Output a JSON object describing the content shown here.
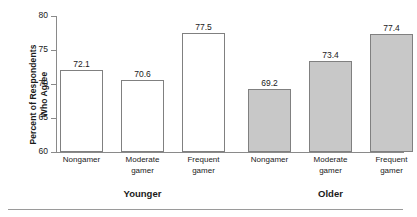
{
  "chart_data": {
    "type": "bar",
    "title": "",
    "xlabel": "",
    "ylabel": "Percent of Respondents\nWho Agree",
    "ylim": [
      60,
      80
    ],
    "yticks": [
      60,
      65,
      70,
      75,
      80
    ],
    "ytick_labels": [
      "60",
      "65",
      "70",
      "75",
      "80"
    ],
    "grid": false,
    "legend": null,
    "categories": [
      "Nongamer",
      "Moderate gamer",
      "Frequent gamer",
      "Nongamer",
      "Moderate gamer",
      "Frequent gamer"
    ],
    "values": [
      72.1,
      70.6,
      77.5,
      69.2,
      73.4,
      77.4
    ],
    "value_labels": [
      "72.1",
      "70.6",
      "77.5",
      "69.2",
      "73.4",
      "77.4"
    ],
    "bar_styles": [
      "open",
      "open",
      "open",
      "filled",
      "filled",
      "filled"
    ],
    "groups": [
      {
        "label": "Younger",
        "categories": [
          "Nongamer",
          "Moderate gamer",
          "Frequent gamer"
        ],
        "values": [
          72.1,
          70.6,
          77.5
        ],
        "style": "open"
      },
      {
        "label": "Older",
        "categories": [
          "Nongamer",
          "Moderate gamer",
          "Frequent gamer"
        ],
        "values": [
          69.2,
          73.4,
          77.4
        ],
        "style": "filled"
      }
    ],
    "colors": {
      "open_fill": "#ffffff",
      "filled_fill": "#c8c8c8",
      "bar_border": "#808080",
      "axis": "#8a8a8a",
      "text": "#1a1a1a"
    }
  },
  "category_label_lines": [
    [
      "Nongamer",
      ""
    ],
    [
      "Moderate",
      "gamer"
    ],
    [
      "Frequent",
      "gamer"
    ],
    [
      "Nongamer",
      ""
    ],
    [
      "Moderate",
      "gamer"
    ],
    [
      "Frequent",
      "gamer"
    ]
  ],
  "y_axis": {
    "title_line1": "Percent of Respondents",
    "title_line2": "Who Agree",
    "tick_labels": [
      "80",
      "75",
      "70",
      "65",
      "60"
    ]
  },
  "group_labels": {
    "younger": "Younger",
    "older": "Older"
  }
}
